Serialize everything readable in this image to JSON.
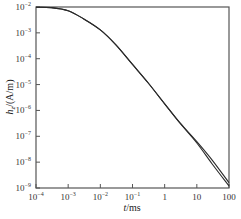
{
  "chart_data": {
    "type": "line",
    "title": "",
    "xlabel": "t/ms",
    "ylabel": "h_z/(A/m)",
    "xscale": "log",
    "yscale": "log",
    "xlim": [
      0.0001,
      100
    ],
    "ylim": [
      1e-09,
      0.01
    ],
    "grid": false,
    "legend": null,
    "x_ticks": [
      {
        "value": 0.0001,
        "base": "10",
        "exp": "−4"
      },
      {
        "value": 0.001,
        "base": "10",
        "exp": "−3"
      },
      {
        "value": 0.01,
        "base": "10",
        "exp": "−2"
      },
      {
        "value": 0.1,
        "base": "10",
        "exp": "−1"
      },
      {
        "value": 1,
        "base": "1",
        "exp": ""
      },
      {
        "value": 10,
        "base": "10",
        "exp": ""
      },
      {
        "value": 100,
        "base": "100",
        "exp": ""
      }
    ],
    "y_ticks": [
      {
        "value": 0.01,
        "base": "10",
        "exp": "−2"
      },
      {
        "value": 0.001,
        "base": "10",
        "exp": "−3"
      },
      {
        "value": 0.0001,
        "base": "10",
        "exp": "−4"
      },
      {
        "value": 1e-05,
        "base": "10",
        "exp": "−5"
      },
      {
        "value": 1e-06,
        "base": "10",
        "exp": "−6"
      },
      {
        "value": 1e-07,
        "base": "10",
        "exp": "−7"
      },
      {
        "value": 1e-08,
        "base": "10",
        "exp": "−8"
      },
      {
        "value": 1e-09,
        "base": "10",
        "exp": "−9"
      }
    ],
    "series": [
      {
        "name": "curve-1",
        "x": [
          0.0001,
          0.0003,
          0.001,
          0.003,
          0.01,
          0.03,
          0.1,
          0.3,
          1,
          3,
          10,
          30,
          100
        ],
        "y": [
          0.0098,
          0.0095,
          0.0072,
          0.0035,
          0.0013,
          0.00035,
          6e-05,
          1.2e-05,
          1.8e-06,
          3.2e-07,
          5.5e-08,
          8.5e-09,
          1.2e-09
        ]
      },
      {
        "name": "curve-2",
        "x": [
          0.0001,
          0.0003,
          0.001,
          0.003,
          0.01,
          0.03,
          0.1,
          0.3,
          1,
          3,
          10,
          30,
          100
        ],
        "y": [
          0.0098,
          0.0095,
          0.0072,
          0.0035,
          0.0013,
          0.00035,
          6e-05,
          1.2e-05,
          1.8e-06,
          3.3e-07,
          6.2e-08,
          1.2e-08,
          1.6e-09
        ]
      }
    ]
  },
  "labels": {
    "xlabel_italic": "t",
    "xlabel_unit": "/ms",
    "ylabel_italic": "h",
    "ylabel_sub": "z",
    "ylabel_unit": "/(A/m)"
  },
  "colors": {
    "axis": "#555555",
    "line": "#2a2a2a"
  }
}
